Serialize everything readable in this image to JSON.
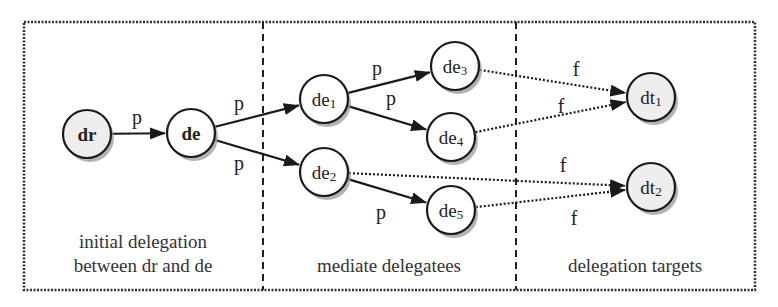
{
  "diagram": {
    "frame": {
      "x": 24,
      "y": 22,
      "width": 731,
      "height": 268
    },
    "dividers": [
      263,
      516
    ],
    "sections": [
      {
        "id": "initial",
        "lines": [
          "initial delegation",
          "between dr and de"
        ],
        "x": 143,
        "y": [
          248,
          272
        ]
      },
      {
        "id": "mediate",
        "lines": [
          "mediate delegatees"
        ],
        "x": 389,
        "y": [
          272
        ]
      },
      {
        "id": "targets",
        "lines": [
          "delegation targets"
        ],
        "x": 635,
        "y": [
          272
        ]
      }
    ],
    "nodes": [
      {
        "id": "dr",
        "base": "dr",
        "sub": "",
        "x": 87,
        "y": 134,
        "fill": "#eeeeee",
        "bold": true
      },
      {
        "id": "de",
        "base": "de",
        "sub": "",
        "x": 191,
        "y": 133,
        "fill": "#ffffff",
        "bold": true
      },
      {
        "id": "de1",
        "base": "de",
        "sub": "1",
        "x": 324,
        "y": 99,
        "fill": "#ffffff",
        "bold": false
      },
      {
        "id": "de2",
        "base": "de",
        "sub": "2",
        "x": 324,
        "y": 172,
        "fill": "#ffffff",
        "bold": false
      },
      {
        "id": "de3",
        "base": "de",
        "sub": "3",
        "x": 455,
        "y": 66,
        "fill": "#ffffff",
        "bold": false
      },
      {
        "id": "de4",
        "base": "de",
        "sub": "4",
        "x": 451,
        "y": 137,
        "fill": "#ffffff",
        "bold": false
      },
      {
        "id": "de5",
        "base": "de",
        "sub": "5",
        "x": 451,
        "y": 210,
        "fill": "#ffffff",
        "bold": false
      },
      {
        "id": "dt1",
        "base": "dt",
        "sub": "1",
        "x": 651,
        "y": 97,
        "fill": "#eeeeee",
        "bold": false
      },
      {
        "id": "dt2",
        "base": "dt",
        "sub": "2",
        "x": 651,
        "y": 187,
        "fill": "#eeeeee",
        "bold": false
      }
    ],
    "node_radius": 24,
    "edges": [
      {
        "from": "dr",
        "to": "de",
        "label": "p",
        "style": "solid",
        "lx": 137,
        "ly": 124
      },
      {
        "from": "de",
        "to": "de1",
        "label": "p",
        "style": "solid",
        "lx": 239,
        "ly": 110
      },
      {
        "from": "de",
        "to": "de2",
        "label": "p",
        "style": "solid",
        "lx": 239,
        "ly": 170
      },
      {
        "from": "de1",
        "to": "de3",
        "label": "p",
        "style": "solid",
        "lx": 377,
        "ly": 75
      },
      {
        "from": "de1",
        "to": "de4",
        "label": "p",
        "style": "solid",
        "lx": 391,
        "ly": 105
      },
      {
        "from": "de2",
        "to": "de5",
        "label": "p",
        "style": "solid",
        "lx": 381,
        "ly": 219
      },
      {
        "from": "de3",
        "to": "dt1",
        "label": "f",
        "style": "dotted",
        "lx": 576,
        "ly": 76
      },
      {
        "from": "de4",
        "to": "dt1",
        "label": "f",
        "style": "dotted",
        "lx": 561,
        "ly": 113
      },
      {
        "from": "de2",
        "to": "dt2",
        "label": "f",
        "style": "dotted",
        "lx": 563,
        "ly": 172
      },
      {
        "from": "de5",
        "to": "dt2",
        "label": "f",
        "style": "dotted",
        "lx": 574,
        "ly": 225
      }
    ],
    "colors": {
      "stroke": "#1a1a1a",
      "shadow": "#9a9a9a",
      "gray_fill": "#eeeeee"
    }
  }
}
